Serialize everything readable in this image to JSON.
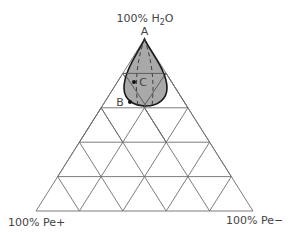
{
  "diagram": {
    "type": "ternary",
    "divisions": 5,
    "vertices": {
      "top": {
        "label": "100% H",
        "sub": "2",
        "tail": "O"
      },
      "bottom_left": {
        "label": "100% Pe+"
      },
      "bottom_right": {
        "label": "100% Pe−"
      }
    },
    "points": {
      "A": {
        "label": "A"
      },
      "B": {
        "label": "B"
      },
      "C": {
        "label": "C"
      }
    },
    "colors": {
      "grid": "#6e6e6e",
      "region_fill": "#a9a9a9",
      "region_stroke": "#1a1a1a",
      "text": "#444444"
    }
  }
}
